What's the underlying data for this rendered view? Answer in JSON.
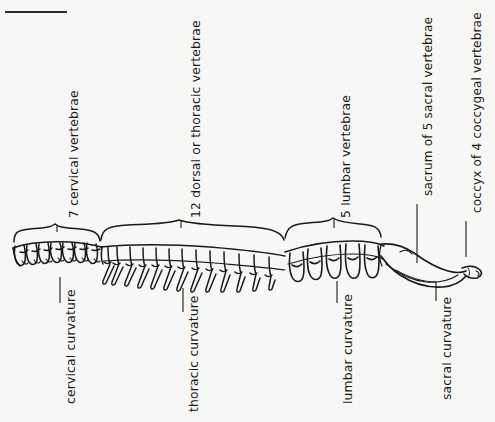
{
  "figure": {
    "background_color": "#f7f7f5",
    "ink_color": "#1a1a1a",
    "top_rule": "horizontal-rule"
  },
  "region_labels": [
    {
      "id": "cervical-count",
      "text": "7 cervical vertebrae",
      "x": 68,
      "y": 218
    },
    {
      "id": "thoracic-count",
      "text": "12 dorsal or thoracic vertebrae",
      "x": 190,
      "y": 218
    },
    {
      "id": "lumbar-count",
      "text": "5 lumbar vertebrae",
      "x": 340,
      "y": 218
    },
    {
      "id": "sacrum-count",
      "text": "sacrum of 5 sacral vertebrae",
      "x": 421,
      "y": 195
    },
    {
      "id": "coccyx-count",
      "text": "coccyx of 4 coccygeal vertebrae",
      "x": 470,
      "y": 212
    }
  ],
  "curvature_labels": [
    {
      "id": "cervical-curvature",
      "text": "cervical curvature",
      "x": 64,
      "y": 404
    },
    {
      "id": "thoracic-curvature",
      "text": "thoracic curvature",
      "x": 187,
      "y": 412
    },
    {
      "id": "lumbar-curvature",
      "text": "lumbar curvature",
      "x": 341,
      "y": 404
    },
    {
      "id": "sacral-curvature",
      "text": "sacral curvature",
      "x": 440,
      "y": 400
    }
  ],
  "braces": [
    {
      "id": "cervical-brace",
      "left": 12,
      "right": 100,
      "tip_x": 57
    },
    {
      "id": "thoracic-brace",
      "left": 100,
      "right": 285,
      "tip_x": 181
    },
    {
      "id": "lumbar-brace",
      "left": 284,
      "right": 382,
      "tip_x": 334
    }
  ],
  "leader_lines": [
    {
      "id": "cervical-count-leader",
      "x1": 57,
      "y1": 232,
      "x2": 57,
      "y2": 226
    },
    {
      "id": "thoracic-count-leader",
      "x1": 181,
      "y1": 228,
      "x2": 181,
      "y2": 222
    },
    {
      "id": "lumbar-count-leader",
      "x1": 334,
      "y1": 228,
      "x2": 334,
      "y2": 222
    },
    {
      "id": "sacrum-count-leader",
      "x1": 417,
      "y1": 205,
      "x2": 417,
      "y2": 262
    },
    {
      "id": "coccyx-count-leader",
      "x1": 466,
      "y1": 222,
      "x2": 466,
      "y2": 258
    },
    {
      "id": "cervical-curvature-leader",
      "x1": 60,
      "y1": 277,
      "x2": 60,
      "y2": 302
    },
    {
      "id": "thoracic-curvature-leader",
      "x1": 183,
      "y1": 290,
      "x2": 183,
      "y2": 310
    },
    {
      "id": "lumbar-curvature-leader",
      "x1": 337,
      "y1": 282,
      "x2": 337,
      "y2": 302
    },
    {
      "id": "sacral-curvature-leader",
      "x1": 436,
      "y1": 283,
      "x2": 436,
      "y2": 300
    }
  ],
  "spine_segments": {
    "cervical": {
      "count": 7,
      "start_x": 14,
      "end_x": 100
    },
    "thoracic": {
      "count": 12,
      "start_x": 101,
      "end_x": 284
    },
    "lumbar": {
      "count": 5,
      "start_x": 286,
      "end_x": 381
    },
    "sacrum": {
      "start_x": 381,
      "end_x": 455
    },
    "coccyx": {
      "start_x": 455,
      "end_x": 480
    }
  }
}
